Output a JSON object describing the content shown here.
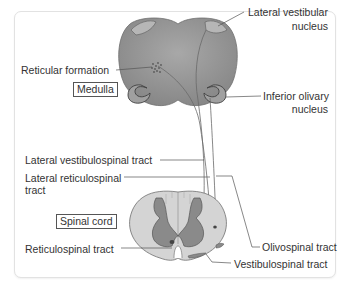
{
  "figure": {
    "structures": {
      "medulla": "Medulla",
      "spinal_cord": "Spinal cord"
    },
    "labels": {
      "reticular_formation": "Reticular formation",
      "lateral_vestibular_nucleus_l1": "Lateral vestibular",
      "lateral_vestibular_nucleus_l2": "nucleus",
      "inferior_olivary_nucleus_l1": "Inferior olivary",
      "inferior_olivary_nucleus_l2": "nucleus",
      "lateral_vestibulospinal_tract": "Lateral vestibulospinal tract",
      "lateral_reticulospinal_tract_l1": "Lateral reticulospinal",
      "lateral_reticulospinal_tract_l2": "tract",
      "reticulospinal_tract": "Reticulospinal tract",
      "olivospinal_tract": "Olivospinal tract",
      "vestibulospinal_tract": "Vestibulospinal tract"
    },
    "colors": {
      "medulla_fill": "#8f8f8f",
      "nucleus_fill": "#b8b8b8",
      "cord_white_matter": "#d4d4d4",
      "cord_gray_matter": "#8a8a8a",
      "leader_line": "#555555",
      "frame_border": "#e2e2e2"
    }
  }
}
